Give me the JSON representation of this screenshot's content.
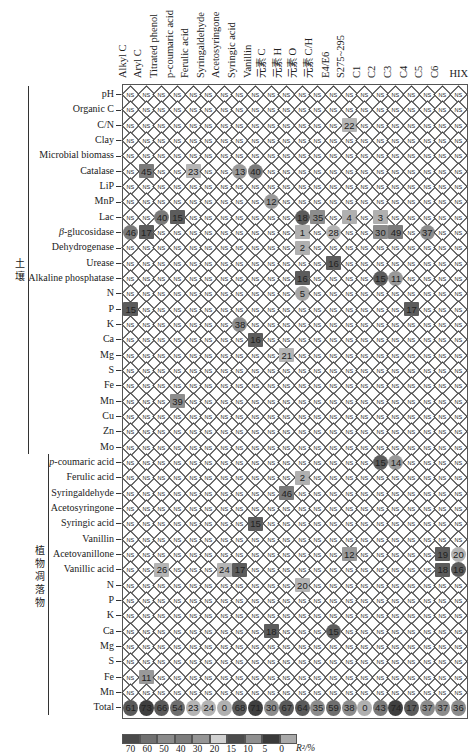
{
  "chart_data": {
    "type": "heatmap",
    "title": "",
    "value_label": "R²/%",
    "columns": [
      "Alkyl C",
      "Aryl C",
      "Titrated phenol",
      "p-coumaric acid",
      "Ferulic acid",
      "Syringaldehyde",
      "Acetosyringone",
      "Syringic acid",
      "Vanillin",
      "元素 C",
      "元素 H",
      "元素 O",
      "元素 C/H",
      "E4/E6",
      "S275~295",
      "C1",
      "C2",
      "C3",
      "C4",
      "C5",
      "C6",
      "HIX"
    ],
    "sections": [
      {
        "name": "土壤",
        "rows": [
          "pH",
          "Organic C",
          "C/N",
          "Clay",
          "Microbial biomass",
          "Catalase",
          "LiP",
          "MnP",
          "Lac",
          "β-glucosidase",
          "Dehydrogenase",
          "Urease",
          "Alkaline phosphatase",
          "N",
          "P",
          "K",
          "Ca",
          "Mg",
          "S",
          "Fe",
          "Mn",
          "Cu",
          "Zn",
          "Mo"
        ]
      },
      {
        "name": "植物凋落物",
        "rows": [
          "p-coumaric acid",
          "Ferulic acid",
          "Syringaldehyde",
          "Acetosyringone",
          "Syringic acid",
          "Vanillin",
          "Acetovanillone",
          "Vanillic acid",
          "N",
          "P",
          "K",
          "Ca",
          "Mg",
          "S",
          "Fe",
          "Mn"
        ]
      }
    ],
    "non_significant_label": "NS",
    "significant_cells": [
      {
        "row": "C/N",
        "section": 0,
        "col": 14,
        "value": 22,
        "shape": "square"
      },
      {
        "row": "Catalase",
        "section": 0,
        "col": 1,
        "value": 45,
        "shape": "square"
      },
      {
        "row": "Catalase",
        "section": 0,
        "col": 4,
        "value": 23,
        "shape": "square"
      },
      {
        "row": "Catalase",
        "section": 0,
        "col": 7,
        "value": 13,
        "shape": "circle"
      },
      {
        "row": "Catalase",
        "section": 0,
        "col": 8,
        "value": 40,
        "shape": "circle"
      },
      {
        "row": "MnP",
        "section": 0,
        "col": 9,
        "value": 12,
        "shape": "circle"
      },
      {
        "row": "Lac",
        "section": 0,
        "col": 2,
        "value": 40,
        "shape": "circle"
      },
      {
        "row": "Lac",
        "section": 0,
        "col": 3,
        "value": 15,
        "shape": "square"
      },
      {
        "row": "Lac",
        "section": 0,
        "col": 11,
        "value": 18,
        "shape": "circle"
      },
      {
        "row": "Lac",
        "section": 0,
        "col": 12,
        "value": 35,
        "shape": "square"
      },
      {
        "row": "Lac",
        "section": 0,
        "col": 14,
        "value": 4,
        "shape": "square"
      },
      {
        "row": "Lac",
        "section": 0,
        "col": 16,
        "value": 3,
        "shape": "square"
      },
      {
        "row": "β-glucosidase",
        "section": 0,
        "col": 0,
        "value": 46,
        "shape": "circle"
      },
      {
        "row": "β-glucosidase",
        "section": 0,
        "col": 1,
        "value": 17,
        "shape": "square"
      },
      {
        "row": "β-glucosidase",
        "section": 0,
        "col": 11,
        "value": 1,
        "shape": "square"
      },
      {
        "row": "β-glucosidase",
        "section": 0,
        "col": 13,
        "value": 28,
        "shape": "circle"
      },
      {
        "row": "β-glucosidase",
        "section": 0,
        "col": 16,
        "value": 30,
        "shape": "square"
      },
      {
        "row": "β-glucosidase",
        "section": 0,
        "col": 17,
        "value": 49,
        "shape": "square"
      },
      {
        "row": "β-glucosidase",
        "section": 0,
        "col": 19,
        "value": 37,
        "shape": "circle"
      },
      {
        "row": "Dehydrogenase",
        "section": 0,
        "col": 11,
        "value": 2,
        "shape": "square"
      },
      {
        "row": "Urease",
        "section": 0,
        "col": 13,
        "value": 16,
        "shape": "square"
      },
      {
        "row": "Alkaline phosphatase",
        "section": 0,
        "col": 11,
        "value": 16,
        "shape": "square"
      },
      {
        "row": "Alkaline phosphatase",
        "section": 0,
        "col": 16,
        "value": 15,
        "shape": "circle"
      },
      {
        "row": "Alkaline phosphatase",
        "section": 0,
        "col": 17,
        "value": 11,
        "shape": "circle"
      },
      {
        "row": "N",
        "section": 0,
        "col": 11,
        "value": 5,
        "shape": "circle"
      },
      {
        "row": "P",
        "section": 0,
        "col": 0,
        "value": 15,
        "shape": "square"
      },
      {
        "row": "P",
        "section": 0,
        "col": 18,
        "value": 17,
        "shape": "square"
      },
      {
        "row": "K",
        "section": 0,
        "col": 7,
        "value": 38,
        "shape": "circle"
      },
      {
        "row": "Ca",
        "section": 0,
        "col": 8,
        "value": 16,
        "shape": "square"
      },
      {
        "row": "Mg",
        "section": 0,
        "col": 10,
        "value": 21,
        "shape": "square"
      },
      {
        "row": "Mn",
        "section": 0,
        "col": 3,
        "value": 39,
        "shape": "square"
      },
      {
        "row": "p-coumaric acid",
        "section": 1,
        "col": 16,
        "value": 15,
        "shape": "circle"
      },
      {
        "row": "p-coumaric acid",
        "section": 1,
        "col": 17,
        "value": 14,
        "shape": "circle"
      },
      {
        "row": "Ferulic acid",
        "section": 1,
        "col": 11,
        "value": 2,
        "shape": "square"
      },
      {
        "row": "Syringaldehyde",
        "section": 1,
        "col": 10,
        "value": 46,
        "shape": "square"
      },
      {
        "row": "Syringic acid",
        "section": 1,
        "col": 8,
        "value": 15,
        "shape": "square"
      },
      {
        "row": "Acetovanillone",
        "section": 1,
        "col": 14,
        "value": 12,
        "shape": "square"
      },
      {
        "row": "Acetovanillone",
        "section": 1,
        "col": 20,
        "value": 19,
        "shape": "square"
      },
      {
        "row": "Acetovanillone",
        "section": 1,
        "col": 21,
        "value": 20,
        "shape": "circle"
      },
      {
        "row": "Vanillic acid",
        "section": 1,
        "col": 2,
        "value": 26,
        "shape": "square"
      },
      {
        "row": "Vanillic acid",
        "section": 1,
        "col": 6,
        "value": 24,
        "shape": "square"
      },
      {
        "row": "Vanillic acid",
        "section": 1,
        "col": 7,
        "value": 17,
        "shape": "square"
      },
      {
        "row": "Vanillic acid",
        "section": 1,
        "col": 20,
        "value": 18,
        "shape": "square"
      },
      {
        "row": "Vanillic acid",
        "section": 1,
        "col": 21,
        "value": 16,
        "shape": "circle"
      },
      {
        "row": "N",
        "section": 1,
        "col": 11,
        "value": 20,
        "shape": "square"
      },
      {
        "row": "Ca",
        "section": 1,
        "col": 9,
        "value": 18,
        "shape": "square"
      },
      {
        "row": "Ca",
        "section": 1,
        "col": 13,
        "value": 15,
        "shape": "circle"
      },
      {
        "row": "Fe",
        "section": 1,
        "col": 1,
        "value": 11,
        "shape": "square"
      }
    ],
    "total_row": {
      "label": "Total",
      "values": [
        61,
        73,
        66,
        54,
        23,
        24,
        0,
        68,
        71,
        30,
        67,
        64,
        35,
        59,
        38,
        0,
        43,
        74,
        17,
        37,
        37,
        36
      ]
    },
    "legend": {
      "ticks": [
        "70",
        "60",
        "50",
        "40",
        "30",
        "20",
        "15",
        "10",
        "5",
        "0"
      ],
      "colors": [
        "#4a4a4a",
        "#707070",
        "#8a8a8a",
        "#7c7c7c",
        "#959595",
        "#d0d0d0",
        "#4c4c4c",
        "#8f8f8f",
        "#3a3a3a",
        "#a9a9a9"
      ],
      "unit": "R²/%"
    }
  }
}
